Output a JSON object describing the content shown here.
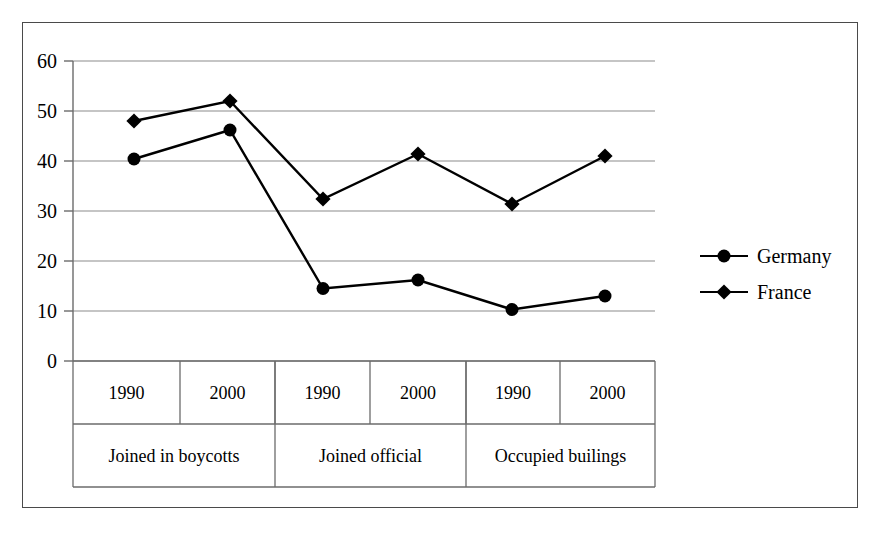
{
  "chart_data": {
    "type": "line",
    "title": "",
    "subtitle": "",
    "xlabel": "",
    "ylabel": "",
    "ylim": [
      0,
      60
    ],
    "yticks": [
      0,
      10,
      20,
      30,
      40,
      50,
      60
    ],
    "grid": true,
    "legend_position": "right",
    "x_tick_labels": [
      "1990",
      "2000",
      "1990",
      "2000",
      "1990",
      "2000"
    ],
    "x_group_labels": [
      "Joined in boycotts",
      "Joined official",
      "Occupied builings"
    ],
    "x_groups": [
      {
        "label": "Joined in boycotts",
        "years": [
          "1990",
          "2000"
        ]
      },
      {
        "label": "Joined official",
        "years": [
          "1990",
          "2000"
        ]
      },
      {
        "label": "Occupied builings",
        "years": [
          "1990",
          "2000"
        ]
      }
    ],
    "series": [
      {
        "name": "Germany",
        "marker": "circle",
        "color": "#000000",
        "values": [
          40.4,
          46.2,
          14.5,
          16.2,
          10.3,
          13.0
        ]
      },
      {
        "name": "France",
        "marker": "diamond",
        "color": "#000000",
        "values": [
          48.0,
          52.0,
          32.4,
          41.4,
          31.4,
          41.0
        ]
      }
    ]
  },
  "legend": {
    "entries": [
      {
        "label": "Germany",
        "marker": "circle"
      },
      {
        "label": "France",
        "marker": "diamond"
      }
    ]
  },
  "axis": {
    "y_labels": [
      "60",
      "50",
      "40",
      "30",
      "20",
      "10",
      "0"
    ]
  },
  "colors": {
    "line": "#000000",
    "grid": "#8c8c8c",
    "axis": "#6b6b6b",
    "frame": "#4a4a4a",
    "text": "#000000"
  }
}
